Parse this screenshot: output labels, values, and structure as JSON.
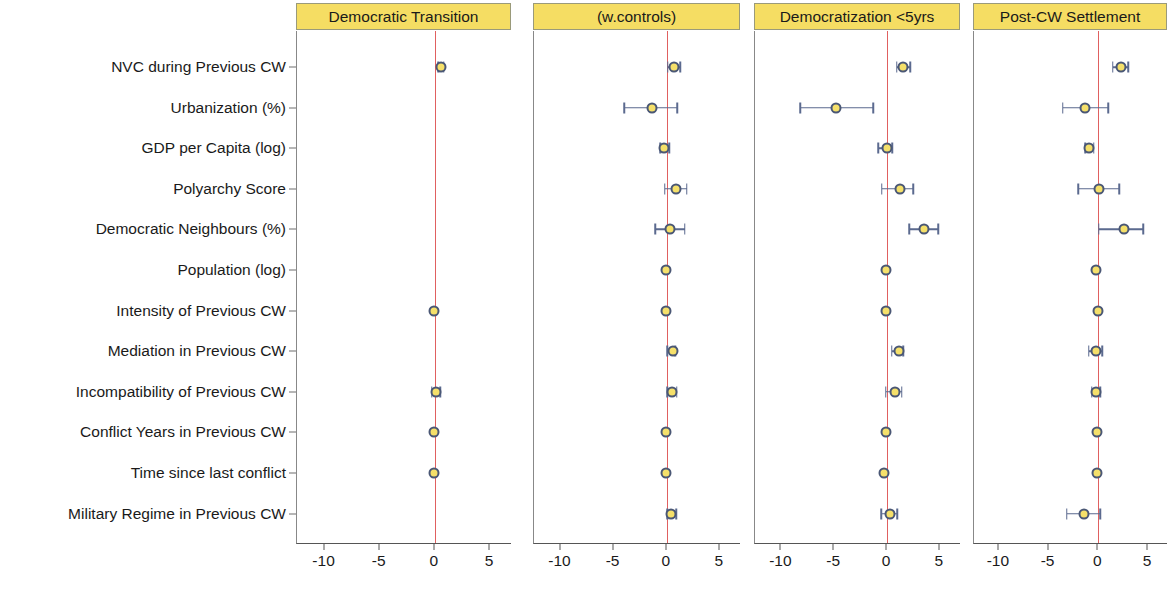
{
  "figure": {
    "type": "coefficient-plot",
    "background": "#ffffff",
    "point_fill": "#f5e06a",
    "point_stroke": "#4a5775",
    "ci_color": "#5b6a8f",
    "zero_line_color": "#e06060",
    "strip_fill": "#f5dd63"
  },
  "chart_data": {
    "type": "scatter",
    "subtype": "dot-and-whisker coefficient plot",
    "title": "",
    "xlabel": "",
    "ylabel": "",
    "xlim": [
      -12.5,
      7.0
    ],
    "xticks": [
      -10,
      -5,
      0,
      5
    ],
    "xticklabels": [
      "-10",
      "-5",
      "0",
      "5"
    ],
    "grid": false,
    "legend": null,
    "zero_reference_line": 0,
    "categories": [
      "NVC during Previous CW",
      "Urbanization (%)",
      "GDP per Capita (log)",
      "Polyarchy Score",
      "Democratic Neighbours (%)",
      "Population (log)",
      "Intensity of Previous CW",
      "Mediation in Previous CW",
      "Incompatibility of Previous CW",
      "Conflict Years in Previous CW",
      "Time since last conflict",
      "Military Regime in Previous CW"
    ],
    "panels": [
      {
        "name": "Democratic Transition",
        "points": [
          {
            "term": "NVC during Previous CW",
            "estimate": 0.55,
            "lower": 0.3,
            "upper": 0.8
          },
          {
            "term": "Urbanization (%)",
            "estimate": null,
            "lower": null,
            "upper": null
          },
          {
            "term": "GDP per Capita (log)",
            "estimate": null,
            "lower": null,
            "upper": null
          },
          {
            "term": "Polyarchy Score",
            "estimate": null,
            "lower": null,
            "upper": null
          },
          {
            "term": "Democratic Neighbours (%)",
            "estimate": null,
            "lower": null,
            "upper": null
          },
          {
            "term": "Population (log)",
            "estimate": null,
            "lower": null,
            "upper": null
          },
          {
            "term": "Intensity of Previous CW",
            "estimate": -0.05,
            "lower": -0.05,
            "upper": -0.05
          },
          {
            "term": "Mediation in Previous CW",
            "estimate": null,
            "lower": null,
            "upper": null
          },
          {
            "term": "Incompatibility of Previous CW",
            "estimate": 0.1,
            "lower": -0.3,
            "upper": 0.5
          },
          {
            "term": "Conflict Years in Previous CW",
            "estimate": -0.05,
            "lower": -0.05,
            "upper": -0.05
          },
          {
            "term": "Time since last conflict",
            "estimate": -0.05,
            "lower": -0.05,
            "upper": -0.05
          },
          {
            "term": "Military Regime in Previous CW",
            "estimate": null,
            "lower": null,
            "upper": null
          }
        ]
      },
      {
        "name": "(w.controls)",
        "points": [
          {
            "term": "NVC during Previous CW",
            "estimate": 0.7,
            "lower": 0.1,
            "upper": 1.3
          },
          {
            "term": "Urbanization (%)",
            "estimate": -1.4,
            "lower": -4.0,
            "upper": 1.0
          },
          {
            "term": "GDP per Capita (log)",
            "estimate": -0.25,
            "lower": -0.6,
            "upper": 0.25
          },
          {
            "term": "Polyarchy Score",
            "estimate": 0.9,
            "lower": -0.2,
            "upper": 1.9
          },
          {
            "term": "Democratic Neighbours (%)",
            "estimate": 0.35,
            "lower": -1.1,
            "upper": 1.7
          },
          {
            "term": "Population (log)",
            "estimate": -0.1,
            "lower": -0.1,
            "upper": -0.1
          },
          {
            "term": "Intensity of Previous CW",
            "estimate": -0.1,
            "lower": -0.1,
            "upper": -0.1
          },
          {
            "term": "Mediation in Previous CW",
            "estimate": 0.55,
            "lower": 0.05,
            "upper": 0.8
          },
          {
            "term": "Incompatibility of Previous CW",
            "estimate": 0.5,
            "lower": 0.05,
            "upper": 0.95
          },
          {
            "term": "Conflict Years in Previous CW",
            "estimate": -0.1,
            "lower": -0.1,
            "upper": -0.1
          },
          {
            "term": "Time since last conflict",
            "estimate": -0.1,
            "lower": -0.1,
            "upper": -0.1
          },
          {
            "term": "Military Regime in Previous CW",
            "estimate": 0.45,
            "lower": 0.05,
            "upper": 0.9
          }
        ]
      },
      {
        "name": "Democratization <5yrs",
        "points": [
          {
            "term": "NVC during Previous CW",
            "estimate": 1.55,
            "lower": 0.9,
            "upper": 2.2
          },
          {
            "term": "Urbanization (%)",
            "estimate": -4.8,
            "lower": -8.2,
            "upper": -1.3
          },
          {
            "term": "GDP per Capita (log)",
            "estimate": -0.05,
            "lower": -0.85,
            "upper": 0.5
          },
          {
            "term": "Polyarchy Score",
            "estimate": 1.2,
            "lower": -0.5,
            "upper": 2.5
          },
          {
            "term": "Democratic Neighbours (%)",
            "estimate": 3.5,
            "lower": 2.1,
            "upper": 4.85
          },
          {
            "term": "Population (log)",
            "estimate": -0.1,
            "lower": -0.1,
            "upper": -0.1
          },
          {
            "term": "Intensity of Previous CW",
            "estimate": -0.1,
            "lower": -0.1,
            "upper": -0.1
          },
          {
            "term": "Mediation in Previous CW",
            "estimate": 1.1,
            "lower": 0.45,
            "upper": 1.55
          },
          {
            "term": "Incompatibility of Previous CW",
            "estimate": 0.75,
            "lower": -0.1,
            "upper": 1.4
          },
          {
            "term": "Conflict Years in Previous CW",
            "estimate": -0.1,
            "lower": -0.1,
            "upper": -0.1
          },
          {
            "term": "Time since last conflict",
            "estimate": -0.25,
            "lower": -0.25,
            "upper": -0.25
          },
          {
            "term": "Military Regime in Previous CW",
            "estimate": 0.25,
            "lower": -0.55,
            "upper": 0.95
          }
        ]
      },
      {
        "name": "Post-CW Settlement",
        "points": [
          {
            "term": "NVC during Previous CW",
            "estimate": 2.25,
            "lower": 1.45,
            "upper": 3.0
          },
          {
            "term": "Urbanization (%)",
            "estimate": -1.3,
            "lower": -3.6,
            "upper": 1.0
          },
          {
            "term": "GDP per Capita (log)",
            "estimate": -0.9,
            "lower": -1.3,
            "upper": -0.45
          },
          {
            "term": "Polyarchy Score",
            "estimate": 0.1,
            "lower": -2.0,
            "upper": 2.1
          },
          {
            "term": "Democratic Neighbours (%)",
            "estimate": 2.55,
            "lower": 0.05,
            "upper": 4.5
          },
          {
            "term": "Population (log)",
            "estimate": -0.25,
            "lower": -0.3,
            "upper": -0.2
          },
          {
            "term": "Intensity of Previous CW",
            "estimate": -0.05,
            "lower": -0.05,
            "upper": -0.05
          },
          {
            "term": "Mediation in Previous CW",
            "estimate": -0.25,
            "lower": -0.95,
            "upper": 0.4
          },
          {
            "term": "Incompatibility of Previous CW",
            "estimate": -0.2,
            "lower": -0.65,
            "upper": 0.2
          },
          {
            "term": "Conflict Years in Previous CW",
            "estimate": -0.1,
            "lower": -0.1,
            "upper": -0.1
          },
          {
            "term": "Time since last conflict",
            "estimate": -0.1,
            "lower": -0.1,
            "upper": -0.1
          },
          {
            "term": "Military Regime in Previous CW",
            "estimate": -1.45,
            "lower": -3.2,
            "upper": 0.2
          }
        ]
      }
    ]
  }
}
